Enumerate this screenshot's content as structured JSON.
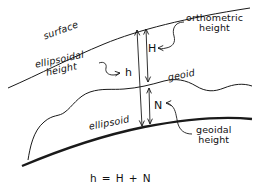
{
  "diagram": {
    "formula": "h = H + N",
    "ink_color": "#1a1a1a",
    "background_color": "#ffffff",
    "curves": {
      "surface_label": "surface",
      "geoid_label": "geoid",
      "ellipsoid_label": "ellipsoid"
    },
    "callouts": {
      "orthometric_line1": "orthometric",
      "orthometric_line2": "height",
      "ellipsoidal_line1": "ellipsoidal",
      "ellipsoidal_line2": "height",
      "geoidal_line1": "geoidal",
      "geoidal_line2": "height"
    },
    "symbols": {
      "h": "h",
      "H": "H",
      "N": "N"
    }
  }
}
